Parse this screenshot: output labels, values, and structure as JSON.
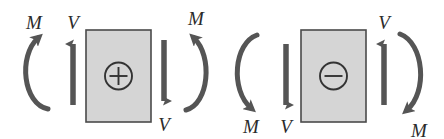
{
  "figure": {
    "background_color": "#ffffff",
    "element_color": "#555555",
    "box_fill_color": "#d5d5d5",
    "box_stroke_color": "#4a4a4a",
    "label_color": "#2b2b2b"
  },
  "panels": [
    {
      "id": "positive",
      "sign_symbol": "+",
      "sign_name": "plus-sign",
      "caption": "Positive internal shear and moment",
      "box": {
        "x": 86,
        "y": 30,
        "width": 65,
        "height": 92
      },
      "labels": {
        "left_moment": "M",
        "left_shear": "V",
        "right_moment": "M",
        "right_shear": "V"
      },
      "arrows": {
        "left_shear_direction": "up",
        "right_shear_direction": "down",
        "left_moment_direction": "counterclockwise-arc-open-right-arrow-top",
        "right_moment_direction": "clockwise-arc-open-left-arrow-top"
      }
    },
    {
      "id": "negative",
      "sign_symbol": "−",
      "sign_name": "minus-sign",
      "caption": "Negative internal shear and moment",
      "box": {
        "x": 301,
        "y": 30,
        "width": 65,
        "height": 92
      },
      "labels": {
        "left_moment": "M",
        "left_shear": "V",
        "right_moment": "M",
        "right_shear": "V"
      },
      "arrows": {
        "left_shear_direction": "down",
        "right_shear_direction": "up",
        "left_moment_direction": "clockwise-arc-open-right-arrow-bottom",
        "right_moment_direction": "counterclockwise-arc-open-left-arrow-bottom"
      }
    }
  ],
  "label_positions": {
    "p1_left_moment": {
      "x": 34,
      "y": 29
    },
    "p1_left_shear": {
      "x": 73,
      "y": 29
    },
    "p1_right_moment": {
      "x": 196,
      "y": 25
    },
    "p1_right_shear": {
      "x": 164,
      "y": 131
    },
    "p2_left_moment": {
      "x": 251,
      "y": 131
    },
    "p2_left_shear": {
      "x": 286,
      "y": 131
    },
    "p2_right_moment": {
      "x": 417,
      "y": 135
    },
    "p2_right_shear": {
      "x": 384,
      "y": 29
    }
  }
}
